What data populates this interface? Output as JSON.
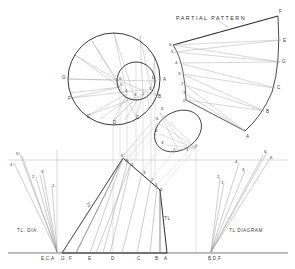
{
  "drawing": {
    "title": "Radial Line Development - Oblique Cone Transition",
    "annotations": {
      "partial_pattern": "PARTIAL PATTERN",
      "tl_dia_left": "TL. DIA.",
      "tl_diagram_right": "TL DIAGRAM",
      "tl_mark_front_left": "TL",
      "tl_mark_front_right": "TL"
    },
    "colors": {
      "heavy_line": "#2b2b2b",
      "light_line": "#9a9a9a",
      "very_light_line": "#c0c0c0",
      "text": "#3a3a3a",
      "background": "#ffffff"
    }
  },
  "top_view": {
    "outer_circle": {
      "center_x": 114,
      "center_y": 79,
      "radius": 46,
      "labels": [
        {
          "id": "A",
          "text": "A",
          "x": 163,
          "y": 81
        },
        {
          "id": "B",
          "text": "B",
          "x": 158,
          "y": 98
        },
        {
          "id": "C",
          "text": "C",
          "x": 136,
          "y": 119
        },
        {
          "id": "D",
          "text": "D",
          "x": 113,
          "y": 124
        },
        {
          "id": "E",
          "text": "E",
          "x": 87,
          "y": 118
        },
        {
          "id": "F",
          "text": "F",
          "x": 68,
          "y": 100
        },
        {
          "id": "G",
          "text": "G",
          "x": 62,
          "y": 79
        }
      ]
    },
    "inner_circle": {
      "center_x": 136,
      "center_y": 81,
      "radius": 19,
      "labels": [
        {
          "id": "0",
          "text": "0",
          "x": 152,
          "y": 79
        },
        {
          "id": "1",
          "text": "1",
          "x": 149,
          "y": 89
        },
        {
          "id": "2",
          "text": "2",
          "x": 142,
          "y": 94
        },
        {
          "id": "3",
          "text": "3",
          "x": 134,
          "y": 96
        },
        {
          "id": "4",
          "text": "4",
          "x": 126,
          "y": 92
        },
        {
          "id": "5",
          "text": "5",
          "x": 121,
          "y": 86
        },
        {
          "id": "6",
          "text": "6",
          "x": 120,
          "y": 79
        }
      ]
    }
  },
  "auxiliary_ellipse": {
    "center_x": 178,
    "center_y": 131,
    "labels": [
      {
        "id": "6",
        "text": "6",
        "x": 161,
        "y": 109
      },
      {
        "id": "5",
        "text": "5",
        "x": 157,
        "y": 119
      },
      {
        "id": "4",
        "text": "4",
        "x": 157,
        "y": 131
      },
      {
        "id": "3",
        "text": "3",
        "x": 163,
        "y": 143
      },
      {
        "id": "2",
        "text": "2",
        "x": 175,
        "y": 150
      },
      {
        "id": "1",
        "text": "1",
        "x": 187,
        "y": 150
      },
      {
        "id": "0",
        "text": "0",
        "x": 196,
        "y": 146
      }
    ]
  },
  "partial_pattern": {
    "title": "PARTIAL PATTERN",
    "title_x": 176,
    "title_y": 20,
    "outer_labels": [
      {
        "id": "F",
        "text": "F",
        "x": 279,
        "y": 13
      },
      {
        "id": "E",
        "text": "E",
        "x": 283,
        "y": 42
      },
      {
        "id": "G",
        "text": "G",
        "x": 281,
        "y": 63
      },
      {
        "id": "C",
        "text": "C",
        "x": 273,
        "y": 89
      },
      {
        "id": "B",
        "text": "B",
        "x": 261,
        "y": 113
      },
      {
        "id": "A",
        "text": "A",
        "x": 245,
        "y": 134
      }
    ],
    "inner_labels": [
      {
        "id": "6",
        "text": "6",
        "x": 171,
        "y": 44
      },
      {
        "id": "5",
        "text": "5",
        "x": 174,
        "y": 51
      },
      {
        "id": "4",
        "text": "4",
        "x": 178,
        "y": 63
      },
      {
        "id": "3",
        "text": "3",
        "x": 181,
        "y": 74
      },
      {
        "id": "2",
        "text": "2",
        "x": 184,
        "y": 84
      },
      {
        "id": "1",
        "text": "1",
        "x": 186,
        "y": 93
      },
      {
        "id": "0",
        "text": "0",
        "x": 186,
        "y": 101
      }
    ]
  },
  "front_view": {
    "labels": [
      {
        "id": "6",
        "text": "6",
        "x": 123,
        "y": 156
      },
      {
        "id": "5",
        "text": "5",
        "x": 127,
        "y": 161
      },
      {
        "id": "4",
        "text": "4",
        "x": 132,
        "y": 165
      },
      {
        "id": "3",
        "text": "3",
        "x": 144,
        "y": 173
      },
      {
        "id": "2",
        "text": "2",
        "x": 152,
        "y": 180
      },
      {
        "id": "1",
        "text": "1",
        "x": 156,
        "y": 184
      },
      {
        "id": "0",
        "text": "0",
        "x": 160,
        "y": 189
      }
    ],
    "tl_mark_left": {
      "text": "TL",
      "x": 89,
      "y": 203
    },
    "tl_mark_right": {
      "text": "TL",
      "x": 164,
      "y": 219
    }
  },
  "tl_dia_left": {
    "caption": "TL. DIA.",
    "caption_x": 17,
    "caption_y": 232,
    "labels": [
      {
        "id": "5",
        "text": "5",
        "x": 17,
        "y": 155
      },
      {
        "id": "4",
        "text": "4",
        "x": 11,
        "y": 165
      },
      {
        "id": "3",
        "text": "3",
        "x": 41,
        "y": 172
      },
      {
        "id": "2",
        "text": "2",
        "x": 33,
        "y": 176
      },
      {
        "id": "1",
        "text": "1",
        "x": 54,
        "y": 184
      }
    ]
  },
  "tl_diagram_right": {
    "caption": "TL DIAGRAM",
    "caption_x": 229,
    "caption_y": 232,
    "labels": [
      {
        "id": "6",
        "text": "6",
        "x": 265,
        "y": 154
      },
      {
        "id": "5",
        "text": "5",
        "x": 270,
        "y": 158
      },
      {
        "id": "4",
        "text": "4",
        "x": 236,
        "y": 162
      },
      {
        "id": "3",
        "text": "3",
        "x": 243,
        "y": 170
      },
      {
        "id": "2",
        "text": "2",
        "x": 218,
        "y": 176
      },
      {
        "id": "1",
        "text": "1",
        "x": 222,
        "y": 181
      }
    ]
  },
  "baseline_labels": {
    "items": [
      {
        "id": "ECA",
        "text": "E,C,A",
        "x": 47,
        "y": 259
      },
      {
        "id": "G",
        "text": "G",
        "x": 64,
        "y": 259
      },
      {
        "id": "F",
        "text": "F",
        "x": 71,
        "y": 259
      },
      {
        "id": "E",
        "text": "E",
        "x": 90,
        "y": 259
      },
      {
        "id": "D",
        "text": "D",
        "x": 114,
        "y": 259
      },
      {
        "id": "C",
        "text": "C",
        "x": 140,
        "y": 259
      },
      {
        "id": "B",
        "text": "B",
        "x": 158,
        "y": 259
      },
      {
        "id": "A",
        "text": "A",
        "x": 167,
        "y": 259
      },
      {
        "id": "BDF",
        "text": "B,D,F",
        "x": 213,
        "y": 259
      }
    ]
  }
}
